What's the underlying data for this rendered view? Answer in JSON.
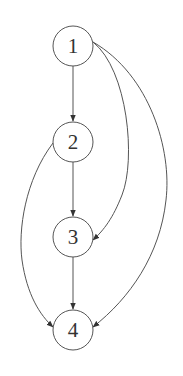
{
  "diagram": {
    "type": "directed-graph",
    "colors": {
      "background": "#ffffff",
      "stroke": "#555555",
      "label": "#333333"
    },
    "nodes": [
      {
        "id": "1",
        "label": "1",
        "cx": 73,
        "cy": 46,
        "r": 20
      },
      {
        "id": "2",
        "label": "2",
        "cx": 73,
        "cy": 142,
        "r": 20
      },
      {
        "id": "3",
        "label": "3",
        "cx": 73,
        "cy": 237,
        "r": 20
      },
      {
        "id": "4",
        "label": "4",
        "cx": 73,
        "cy": 330,
        "r": 20
      }
    ],
    "edges": [
      {
        "from": "1",
        "to": "2",
        "style": "straight"
      },
      {
        "from": "1",
        "to": "3",
        "style": "curved-right"
      },
      {
        "from": "1",
        "to": "4",
        "style": "curved-right-wide"
      },
      {
        "from": "2",
        "to": "3",
        "style": "straight"
      },
      {
        "from": "2",
        "to": "4",
        "style": "curved-left"
      },
      {
        "from": "3",
        "to": "4",
        "style": "straight"
      }
    ]
  }
}
